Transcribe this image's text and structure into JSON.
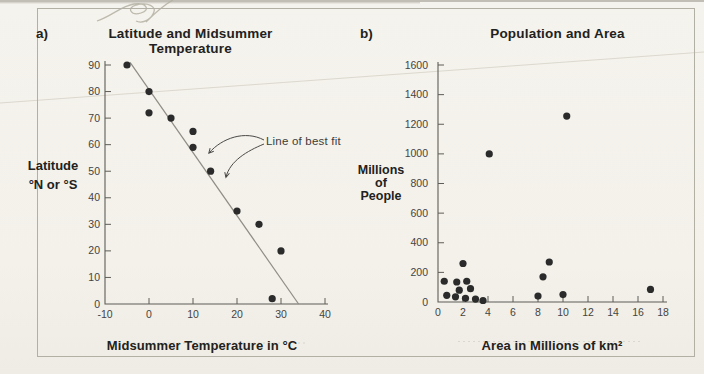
{
  "page": {
    "background_color": "#f3f1ea",
    "figure_border_color": "#b2afa5",
    "axis_color": "#5f5d57",
    "tick_label_color": "#454442",
    "text_color": "#222120"
  },
  "chart_data": [
    {
      "id": "a",
      "panel_label": "a)",
      "type": "scatter",
      "title": "Latitude and Midsummer Temperature",
      "xlabel": "Midsummer Temperature in °C",
      "ylabel_lines": [
        "Latitude",
        "°N or °S"
      ],
      "xlim": [
        -10,
        40
      ],
      "ylim": [
        0,
        90
      ],
      "xticks": [
        -10,
        0,
        10,
        20,
        30,
        40
      ],
      "yticks": [
        0,
        10,
        20,
        30,
        40,
        50,
        60,
        70,
        80,
        90
      ],
      "grid": false,
      "point_color": "#2b2b2b",
      "points": [
        [
          -5,
          90
        ],
        [
          0,
          80
        ],
        [
          0,
          72
        ],
        [
          5,
          70
        ],
        [
          10,
          65
        ],
        [
          10,
          59
        ],
        [
          14,
          50
        ],
        [
          20,
          35
        ],
        [
          25,
          30
        ],
        [
          30,
          20
        ],
        [
          28,
          2
        ]
      ],
      "best_fit_line": {
        "x1": -4.3,
        "y1": 91,
        "x2": 34,
        "y2": 0
      },
      "line_color": "#8f8d85",
      "annotation": "Line of best fit"
    },
    {
      "id": "b",
      "panel_label": "b)",
      "type": "scatter",
      "title": "Population and Area",
      "xlabel": "Area in Millions of km²",
      "ylabel_lines": [
        "Millions",
        "of",
        "People"
      ],
      "xlim": [
        0,
        18
      ],
      "ylim": [
        0,
        1600
      ],
      "xticks": [
        0,
        2,
        4,
        6,
        8,
        10,
        12,
        14,
        16,
        18
      ],
      "yticks": [
        0,
        200,
        400,
        600,
        800,
        1000,
        1200,
        1400,
        1600
      ],
      "grid": false,
      "point_color": "#2b2b2b",
      "points": [
        [
          0.5,
          140
        ],
        [
          0.7,
          45
        ],
        [
          1.4,
          35
        ],
        [
          1.5,
          135
        ],
        [
          1.7,
          80
        ],
        [
          2.0,
          260
        ],
        [
          2.2,
          25
        ],
        [
          2.3,
          140
        ],
        [
          2.6,
          90
        ],
        [
          3.0,
          20
        ],
        [
          3.6,
          10
        ],
        [
          4.1,
          1000
        ],
        [
          8.0,
          40
        ],
        [
          8.4,
          170
        ],
        [
          8.9,
          270
        ],
        [
          10.0,
          50
        ],
        [
          10.3,
          1255
        ],
        [
          17.0,
          85
        ]
      ]
    }
  ]
}
